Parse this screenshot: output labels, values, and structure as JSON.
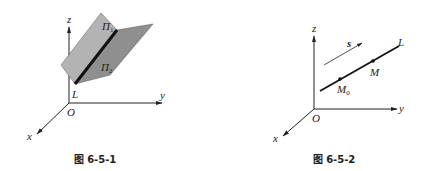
{
  "figures": [
    {
      "id": "fig1",
      "caption": "图 6-5-1",
      "axes": {
        "x": "x",
        "y": "y",
        "z": "z",
        "origin": "O"
      },
      "planes": [
        {
          "label": "Π",
          "subscript": "1",
          "fill": "#b3b3b3"
        },
        {
          "label": "Π",
          "subscript": "2",
          "fill": "#8f8f8f"
        }
      ],
      "line_label": "L"
    },
    {
      "id": "fig2",
      "caption": "图 6-5-2",
      "axes": {
        "x": "x",
        "y": "y",
        "z": "z",
        "origin": "O"
      },
      "line_label": "L",
      "direction_vector": "s",
      "points": [
        {
          "label": "M",
          "subscript": "0"
        },
        {
          "label": "M",
          "subscript": ""
        }
      ]
    }
  ],
  "colors": {
    "ink": "#222222",
    "plane1": "#b3b3b3",
    "plane2": "#8f8f8f",
    "background": "#ffffff"
  }
}
